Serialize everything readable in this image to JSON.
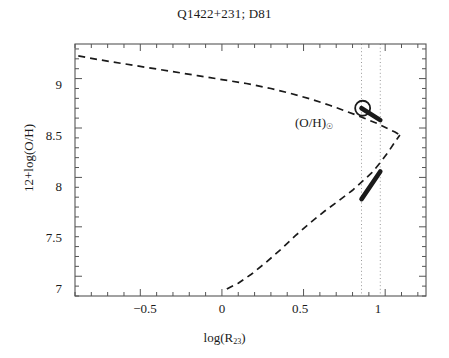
{
  "chart_data": {
    "type": "line",
    "title": "Q1422+231; D81",
    "xlabel_main": "log(R",
    "xlabel_sub": "23",
    "xlabel_tail": ")",
    "ylabel": "12+log(O/H)",
    "xlim": [
      -0.9,
      1.25
    ],
    "ylim": [
      6.8,
      9.35
    ],
    "xticks": [
      -0.5,
      0,
      0.5,
      1
    ],
    "xtick_labels": [
      "−0.5",
      "0",
      "0.5",
      "1"
    ],
    "yticks": [
      7,
      7.5,
      8,
      8.5,
      9
    ],
    "ytick_labels": [
      "7",
      "7.5",
      "8",
      "8.5",
      "9"
    ],
    "grid": false,
    "legend": "none",
    "series": [
      {
        "name": "upper branch",
        "style": "dashed",
        "x": [
          -0.88,
          -0.75,
          -0.6,
          -0.45,
          -0.3,
          -0.15,
          0.0,
          0.15,
          0.3,
          0.42,
          0.55,
          0.66,
          0.76,
          0.84,
          0.9,
          0.96,
          1.02,
          1.06,
          1.09
        ],
        "y": [
          9.23,
          9.19,
          9.15,
          9.11,
          9.07,
          9.03,
          8.99,
          8.95,
          8.9,
          8.85,
          8.79,
          8.73,
          8.67,
          8.62,
          8.58,
          8.54,
          8.49,
          8.46,
          8.43
        ]
      },
      {
        "name": "lower branch",
        "style": "dashed",
        "x": [
          0.03,
          0.1,
          0.18,
          0.27,
          0.36,
          0.45,
          0.54,
          0.63,
          0.72,
          0.8,
          0.86,
          0.92,
          0.97,
          1.02,
          1.06,
          1.09
        ],
        "y": [
          6.87,
          6.93,
          7.02,
          7.14,
          7.27,
          7.41,
          7.54,
          7.66,
          7.77,
          7.87,
          7.96,
          8.05,
          8.15,
          8.26,
          8.36,
          8.43
        ]
      },
      {
        "name": "allowed solution upper branch",
        "style": "thick-solid",
        "x": [
          0.855,
          0.97
        ],
        "y": [
          8.7,
          8.58
        ]
      },
      {
        "name": "allowed solution lower branch",
        "style": "thick-solid",
        "x": [
          0.855,
          0.97
        ],
        "y": [
          7.78,
          8.06
        ]
      }
    ],
    "annotations": [
      {
        "name": "solar-oh-label",
        "text": "(O/H)",
        "subscript": "☉",
        "x": 0.6,
        "y": 8.68
      },
      {
        "name": "solar-oh-marker",
        "marker": "open-circle",
        "x": 0.862,
        "y": 8.7
      }
    ],
    "vlines": [
      {
        "name": "r23-lower-bound",
        "x": 0.855,
        "style": "dotted"
      },
      {
        "name": "r23-upper-bound",
        "x": 0.97,
        "style": "dotted"
      }
    ],
    "colors": {
      "curve": "#1a1a1a",
      "axis": "#555555",
      "vline": "#999999",
      "text": "#1a1a1a",
      "background": "#ffffff"
    }
  }
}
